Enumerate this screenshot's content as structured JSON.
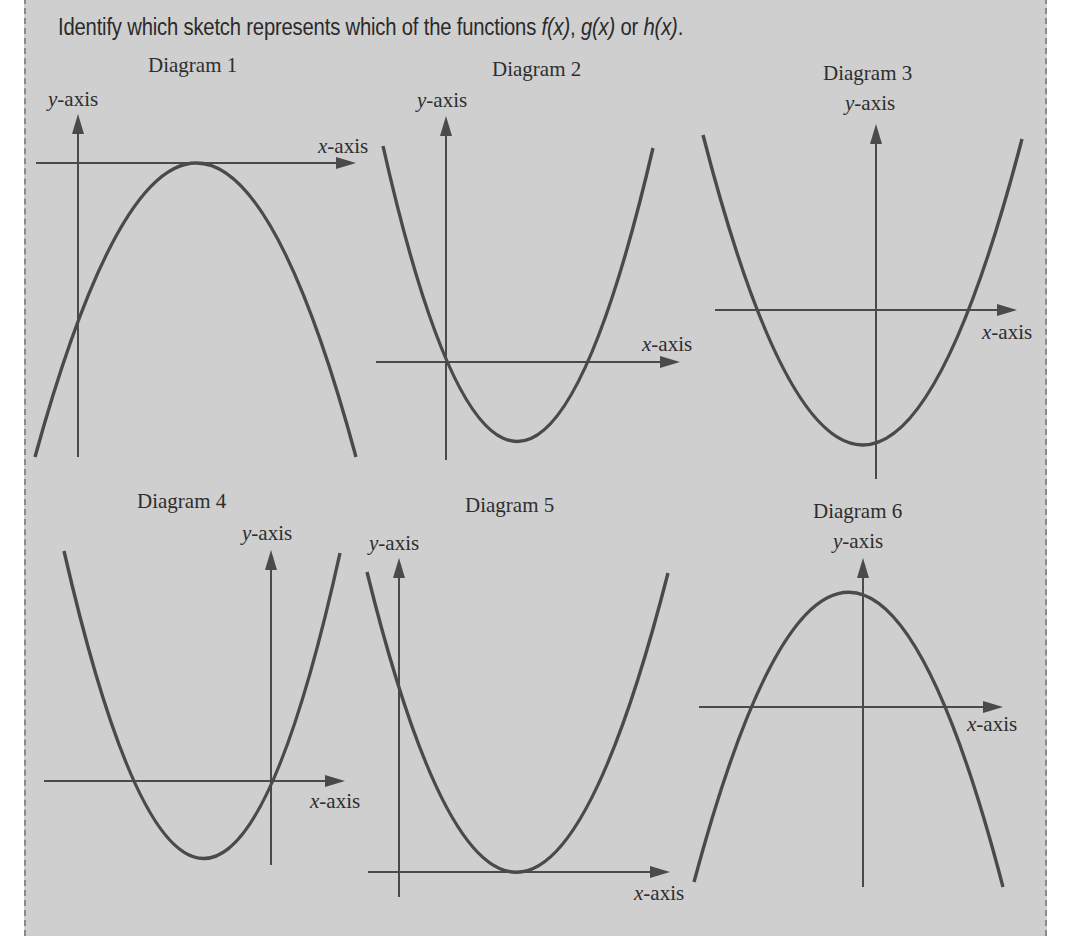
{
  "prompt": {
    "text_before": "Identify which sketch represents which of the functions ",
    "f": "f(x)",
    "sep1": ", ",
    "g": "g(x)",
    "sep2": " or ",
    "h": "h(x)",
    "end": "."
  },
  "axis_labels": {
    "x": "x",
    "y": "y",
    "suffix": "-axis"
  },
  "diagrams": [
    {
      "title": "Diagram 1",
      "shape": "downward parabola, vertex touching x-axis to the right of y-axis"
    },
    {
      "title": "Diagram 2",
      "shape": "upward parabola through origin, second root positive"
    },
    {
      "title": "Diagram 3",
      "shape": "upward parabola, two roots either side of origin, vertex slightly left"
    },
    {
      "title": "Diagram 4",
      "shape": "upward parabola through origin, second root negative"
    },
    {
      "title": "Diagram 5",
      "shape": "upward parabola, vertex touching x-axis to the right of y-axis"
    },
    {
      "title": "Diagram 6",
      "shape": "downward parabola, two roots either side of origin, vertex slightly left"
    }
  ],
  "colors": {
    "panel": "#cfcfcf",
    "ink": "#4a4a4a",
    "border": "#8a8a8a"
  }
}
